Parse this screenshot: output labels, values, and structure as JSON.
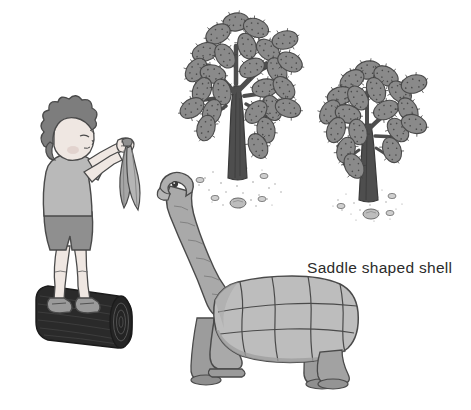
{
  "illustration": {
    "title": "Boy feeding a saddle-backed Galapagos tortoise near prickly pear cactus trees",
    "background_color": "#ffffff",
    "annotations": [
      {
        "id": "shell-label",
        "text": "Saddle shaped shell",
        "color": "#2b2b2b",
        "x": 307,
        "y": 259
      }
    ],
    "palette": {
      "ink": "#3a3a3a",
      "outline": "#4a4a4a",
      "skin": "#efe7e2",
      "hair": "#7d7d7d",
      "shirt": "#b9b9b9",
      "shorts": "#8f8f8f",
      "shoes": "#9a9a9a",
      "log_dark": "#2a2a2a",
      "log_darker": "#1b1b1b",
      "tortoise_body": "#a9a9a9",
      "tortoise_shell": "#bdbdbd",
      "tortoise_shell_shade": "#9d9d9d",
      "cactus_pad": "#8a8a8a",
      "cactus_trunk": "#4e4e4e",
      "stone": "#bdbdbd",
      "leaf": "#a6a6a6",
      "label_text": "#2b2b2b"
    },
    "elements": [
      {
        "name": "boy",
        "description": "Child with spiky dark hair, grey t-shirt and shorts, standing on a log, arms raised holding leaves"
      },
      {
        "name": "log",
        "description": "Dark fallen tree log the boy stands on"
      },
      {
        "name": "leaves",
        "description": "Two long leaves held up as food"
      },
      {
        "name": "tortoise",
        "description": "Galapagos tortoise with long outstretched neck and saddle shaped shell"
      },
      {
        "name": "cactus-tree-large",
        "description": "Tall prickly pear cactus tree with oval pads"
      },
      {
        "name": "cactus-tree-small",
        "description": "Smaller prickly pear cactus tree with oval pads"
      },
      {
        "name": "ground-stones",
        "description": "Scattered pebbles and stippled sand at the bases of the cactus trees"
      }
    ]
  }
}
